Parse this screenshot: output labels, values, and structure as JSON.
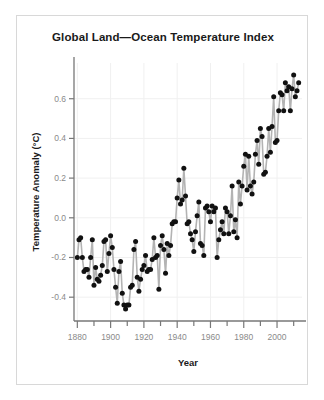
{
  "chart_data": {
    "type": "line",
    "title": "Global Land—Ocean Temperature Index",
    "xlabel": "Year",
    "ylabel": "Temperature Anomaly (°C)",
    "xlim": [
      1878,
      2015
    ],
    "ylim": [
      -0.52,
      0.78
    ],
    "grid": true,
    "legend": "none",
    "marker": "filled-circle",
    "line_color": "#b3b3b3",
    "marker_color": "#111111",
    "x_major_ticks": [
      1880,
      1900,
      1920,
      1940,
      1960,
      1980,
      2000
    ],
    "x_minor_tick_interval": 10,
    "y_ticks": [
      -0.4,
      -0.2,
      0.0,
      0.2,
      0.4,
      0.6
    ],
    "x_tick_labels": [
      "1880",
      "1900",
      "1920",
      "1940",
      "1960",
      "1980",
      "2000"
    ],
    "y_tick_labels": [
      "-0.4",
      "-0.2",
      "0.0",
      "0.2",
      "0.4",
      "0.6"
    ],
    "x": [
      1880,
      1881,
      1882,
      1883,
      1884,
      1885,
      1886,
      1887,
      1888,
      1889,
      1890,
      1891,
      1892,
      1893,
      1894,
      1895,
      1896,
      1897,
      1898,
      1899,
      1900,
      1901,
      1902,
      1903,
      1904,
      1905,
      1906,
      1907,
      1908,
      1909,
      1910,
      1911,
      1912,
      1913,
      1914,
      1915,
      1916,
      1917,
      1918,
      1919,
      1920,
      1921,
      1922,
      1923,
      1924,
      1925,
      1926,
      1927,
      1928,
      1929,
      1930,
      1931,
      1932,
      1933,
      1934,
      1935,
      1936,
      1937,
      1938,
      1939,
      1940,
      1941,
      1942,
      1943,
      1944,
      1945,
      1946,
      1947,
      1948,
      1949,
      1950,
      1951,
      1952,
      1953,
      1954,
      1955,
      1956,
      1957,
      1958,
      1959,
      1960,
      1961,
      1962,
      1963,
      1964,
      1965,
      1966,
      1967,
      1968,
      1969,
      1970,
      1971,
      1972,
      1973,
      1974,
      1975,
      1976,
      1977,
      1978,
      1979,
      1980,
      1981,
      1982,
      1983,
      1984,
      1985,
      1986,
      1987,
      1988,
      1989,
      1990,
      1991,
      1992,
      1993,
      1994,
      1995,
      1996,
      1997,
      1998,
      1999,
      2000,
      2001,
      2002,
      2003,
      2004,
      2005,
      2006,
      2007,
      2008,
      2009,
      2010,
      2011,
      2012,
      2013
    ],
    "y": [
      -0.2,
      -0.11,
      -0.1,
      -0.2,
      -0.27,
      -0.26,
      -0.26,
      -0.3,
      -0.2,
      -0.11,
      -0.34,
      -0.25,
      -0.31,
      -0.32,
      -0.29,
      -0.24,
      -0.12,
      -0.11,
      -0.27,
      -0.18,
      -0.09,
      -0.15,
      -0.26,
      -0.35,
      -0.43,
      -0.27,
      -0.22,
      -0.38,
      -0.44,
      -0.46,
      -0.44,
      -0.44,
      -0.35,
      -0.34,
      -0.16,
      -0.12,
      -0.3,
      -0.37,
      -0.31,
      -0.26,
      -0.24,
      -0.19,
      -0.27,
      -0.26,
      -0.26,
      -0.21,
      -0.1,
      -0.2,
      -0.19,
      -0.36,
      -0.14,
      -0.09,
      -0.16,
      -0.28,
      -0.13,
      -0.19,
      -0.14,
      -0.03,
      -0.02,
      -0.02,
      0.1,
      0.19,
      0.07,
      0.09,
      0.25,
      0.11,
      -0.03,
      -0.02,
      -0.08,
      -0.11,
      -0.17,
      -0.07,
      0.01,
      0.08,
      -0.13,
      -0.14,
      -0.19,
      0.05,
      0.06,
      0.03,
      -0.02,
      0.06,
      0.03,
      0.05,
      -0.2,
      -0.11,
      -0.06,
      -0.02,
      -0.08,
      0.05,
      0.03,
      -0.08,
      0.01,
      0.16,
      -0.07,
      -0.01,
      -0.1,
      0.18,
      0.07,
      0.16,
      0.26,
      0.32,
      0.14,
      0.31,
      0.16,
      0.12,
      0.18,
      0.32,
      0.39,
      0.27,
      0.45,
      0.41,
      0.22,
      0.23,
      0.31,
      0.45,
      0.33,
      0.46,
      0.61,
      0.38,
      0.39,
      0.54,
      0.63,
      0.62,
      0.54,
      0.68,
      0.64,
      0.66,
      0.54,
      0.65,
      0.72,
      0.61,
      0.64,
      0.68
    ]
  },
  "figure": {
    "title": "Global Land—Ocean Temperature Index",
    "xlabel": "Year",
    "ylabel": "Temperature Anomaly (°C)"
  }
}
